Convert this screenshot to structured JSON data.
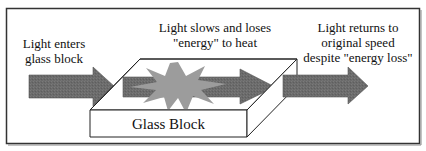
{
  "diagram": {
    "colors": {
      "frame": "#333333",
      "arrow_fill": "#6b6b6b",
      "arrow_fill_dark": "#5a5a5a",
      "starburst_fill": "#9a9a9a",
      "glass_face": "#ffffff",
      "glass_edge": "#222222",
      "text": "#111111"
    },
    "stages": [
      {
        "id": "enter",
        "lines": [
          "Light enters",
          "glass block"
        ]
      },
      {
        "id": "slow",
        "lines": [
          "Light slows and loses",
          "\"energy\" to heat"
        ]
      },
      {
        "id": "return",
        "lines": [
          "Light returns to",
          "original speed",
          "despite \"energy loss\""
        ]
      }
    ],
    "glass_block": {
      "label": "Glass Block"
    },
    "icons": {
      "incoming_arrow": "right-arrow",
      "inner_arrow": "right-arrow",
      "outgoing_arrow": "right-arrow",
      "heat_burst": "starburst"
    }
  }
}
